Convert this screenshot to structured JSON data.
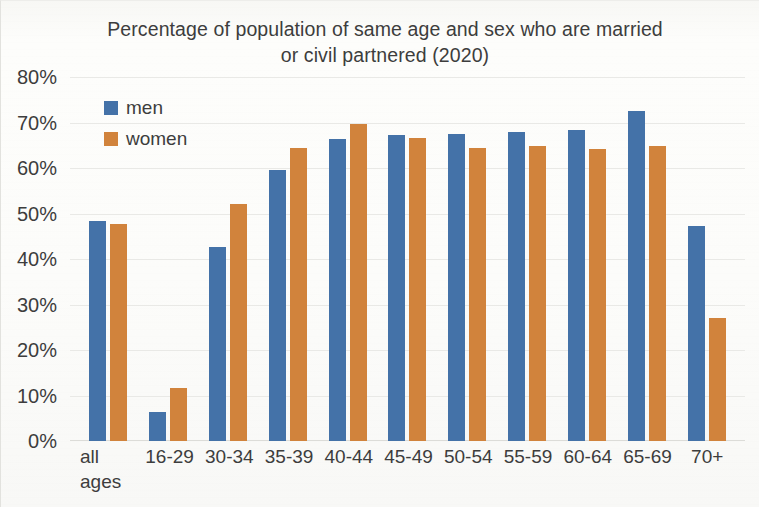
{
  "chart_data": {
    "type": "bar",
    "title": "Percentage of population of same age and sex who are married or civil partnered (2020)",
    "title_line1": "Percentage of population of same age and sex who are married",
    "title_line2": "or civil partnered (2020)",
    "xlabel": "",
    "ylabel": "",
    "ylim": [
      0,
      80
    ],
    "ytick_labels": [
      "80%",
      "70%",
      "60%",
      "50%",
      "40%",
      "30%",
      "20%",
      "10%",
      "0%"
    ],
    "ytick_values": [
      80,
      70,
      60,
      50,
      40,
      30,
      20,
      10,
      0
    ],
    "grid": true,
    "grid_axis": "y",
    "legend_position": "upper-left-inside",
    "categories": [
      "all\nages",
      "16-29",
      "30-34",
      "35-39",
      "40-44",
      "45-49",
      "50-54",
      "55-59",
      "60-64",
      "65-69",
      "70+"
    ],
    "series": [
      {
        "name": "men",
        "color": "#4472C4",
        "values": [
          48.3,
          6.4,
          42.7,
          59.6,
          66.4,
          67.2,
          67.5,
          67.9,
          68.4,
          72.5,
          47.3
        ]
      },
      {
        "name": "women",
        "color": "#ED7D31",
        "values": [
          47.7,
          11.6,
          52.0,
          64.3,
          69.6,
          66.6,
          64.3,
          64.9,
          64.1,
          64.9,
          27.0
        ]
      }
    ]
  },
  "legend": {
    "entries": [
      {
        "label": "men",
        "swatch": "men"
      },
      {
        "label": "women",
        "swatch": "women"
      }
    ]
  }
}
